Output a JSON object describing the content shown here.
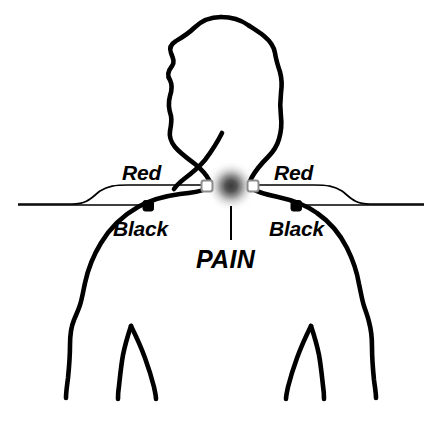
{
  "diagram": {
    "type": "electrode-placement-diagram",
    "background_color": "#ffffff",
    "outline_color": "#000000",
    "labels": {
      "lead_left_top": "Red",
      "lead_left_bottom": "Black",
      "lead_right_top": "Red",
      "lead_right_bottom": "Black",
      "pain_marker": "PAIN"
    },
    "electrodes": {
      "red_left": {
        "label": "Red",
        "marker": "hollow-square",
        "fill": "#ffffff",
        "stroke": "#808080",
        "x": 207,
        "y": 186
      },
      "red_right": {
        "label": "Red",
        "marker": "hollow-square",
        "fill": "#ffffff",
        "stroke": "#808080",
        "x": 253,
        "y": 186
      },
      "black_left": {
        "label": "Black",
        "marker": "filled-square",
        "fill": "#000000",
        "stroke": "#000000",
        "x": 148,
        "y": 206
      },
      "black_right": {
        "label": "Black",
        "marker": "filled-square",
        "fill": "#000000",
        "stroke": "#000000",
        "x": 296,
        "y": 206
      }
    },
    "pain_spot": {
      "label": "PAIN",
      "center_x": 231,
      "center_y": 186,
      "radius": 24,
      "center_color": "#4d4d4d",
      "edge_color": "#ffffff"
    }
  }
}
